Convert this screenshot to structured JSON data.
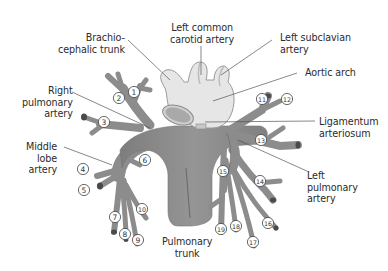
{
  "figure": {
    "colors": {
      "vessel_fill": "#8f8f8f",
      "vessel_dark": "#707070",
      "aorta_fill": "#e6e6e6",
      "aorta_outline": "#9a9a9a",
      "leader_line": "#555555",
      "text": "#2b2b2b"
    },
    "labels": {
      "brachiocephalic": "Brachio-\ncephalic trunk",
      "left_common_carotid": "Left common\ncarotid artery",
      "left_subclavian": "Left subclavian\nartery",
      "aortic_arch": "Aortic arch",
      "right_pulmonary": "Right\npulmonary\nartery",
      "ligamentum": "Ligamentum\narteriosum",
      "middle_lobe": "Middle\nlobe\nartery",
      "left_pulmonary": "Left\npulmonary\nartery",
      "pulmonary_trunk": "Pulmonary\ntrunk"
    },
    "segment_numbers": [
      {
        "n": "1",
        "x": 134,
        "y": 92
      },
      {
        "n": "2",
        "x": 119,
        "y": 98
      },
      {
        "n": "3",
        "x": 104,
        "y": 122
      },
      {
        "n": "4",
        "x": 83,
        "y": 169
      },
      {
        "n": "5",
        "x": 84,
        "y": 190
      },
      {
        "n": "6",
        "x": 145,
        "y": 160
      },
      {
        "n": "7",
        "x": 115,
        "y": 217
      },
      {
        "n": "8",
        "x": 125,
        "y": 234
      },
      {
        "n": "9",
        "x": 138,
        "y": 240
      },
      {
        "n": "10",
        "x": 142,
        "y": 209
      },
      {
        "n": "11",
        "x": 262,
        "y": 99
      },
      {
        "n": "12",
        "x": 287,
        "y": 99
      },
      {
        "n": "13",
        "x": 261,
        "y": 140
      },
      {
        "n": "14",
        "x": 260,
        "y": 181
      },
      {
        "n": "15",
        "x": 223,
        "y": 171
      },
      {
        "n": "16",
        "x": 268,
        "y": 223
      },
      {
        "n": "17",
        "x": 253,
        "y": 242
      },
      {
        "n": "18",
        "x": 236,
        "y": 226
      },
      {
        "n": "19",
        "x": 221,
        "y": 229
      }
    ]
  }
}
